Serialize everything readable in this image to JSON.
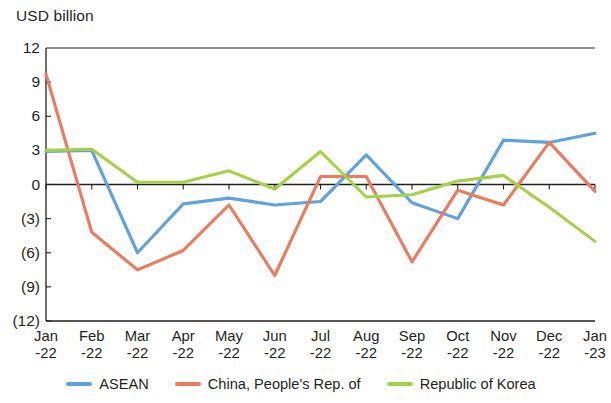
{
  "chart_data": {
    "type": "line",
    "title": "",
    "ylabel": "USD billion",
    "xlabel": "",
    "ylim": [
      -12,
      12
    ],
    "yticks": [
      12,
      9,
      6,
      3,
      0,
      -3,
      -6,
      -9,
      -12
    ],
    "ytick_labels": [
      "12",
      "9",
      "6",
      "3",
      "0",
      "(3)",
      "(6)",
      "(9)",
      "(12)"
    ],
    "grid": false,
    "legend_position": "bottom",
    "categories": [
      "Jan-22",
      "Feb-22",
      "Mar-22",
      "Apr-22",
      "May-22",
      "Jun-22",
      "Jul-22",
      "Aug-22",
      "Sep-22",
      "Oct-22",
      "Nov-22",
      "Dec-22",
      "Jan-23"
    ],
    "xtick_months": [
      "Jan",
      "Feb",
      "Mar",
      "Apr",
      "May",
      "Jun",
      "Jul",
      "Aug",
      "Sep",
      "Oct",
      "Nov",
      "Dec",
      "Jan"
    ],
    "xtick_years": [
      "-22",
      "-22",
      "-22",
      "-22",
      "-22",
      "-22",
      "-22",
      "-22",
      "-22",
      "-22",
      "-22",
      "-22",
      "-23"
    ],
    "series": [
      {
        "name": "ASEAN",
        "color": "#5FA2DD",
        "values": [
          2.9,
          3.0,
          -6.0,
          -1.7,
          -1.2,
          -1.8,
          -1.5,
          2.6,
          -1.6,
          -3.0,
          3.9,
          3.7,
          4.5
        ]
      },
      {
        "name": "China, People's Rep. of",
        "color": "#EC7A5C",
        "values": [
          9.7,
          -4.2,
          -7.5,
          -5.8,
          -1.8,
          -8.0,
          0.7,
          0.7,
          -6.8,
          -0.5,
          -1.8,
          3.7,
          -0.6
        ]
      },
      {
        "name": "Republic of Korea",
        "color": "#A4D246",
        "values": [
          3.0,
          3.1,
          0.2,
          0.2,
          1.2,
          -0.4,
          2.9,
          -1.1,
          -0.9,
          0.3,
          0.8,
          -2.0,
          -5.0
        ]
      }
    ]
  },
  "legend": {
    "items": [
      {
        "label": "ASEAN",
        "color": "#5FA2DD"
      },
      {
        "label": "China, People's Rep. of",
        "color": "#EC7A5C"
      },
      {
        "label": "Republic of Korea",
        "color": "#A4D246"
      }
    ]
  }
}
